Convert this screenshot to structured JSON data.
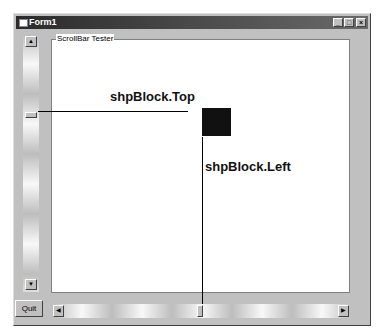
{
  "window": {
    "title": "Form1",
    "controls": {
      "minimize": "_",
      "maximize": "□",
      "close": "×"
    }
  },
  "frame": {
    "caption": "ScrollBar Tester"
  },
  "labels": {
    "top": "shpBlock.Top",
    "left": "shpBlock.Left"
  },
  "vscroll": {
    "up_arrow": "▲",
    "down_arrow": "▼"
  },
  "hscroll": {
    "left_arrow": "◀",
    "right_arrow": "▶"
  },
  "buttons": {
    "quit": "Quit"
  },
  "colors": {
    "block": "#111111",
    "titlebar": "#2a2a2a",
    "face": "#c0c0c0"
  }
}
